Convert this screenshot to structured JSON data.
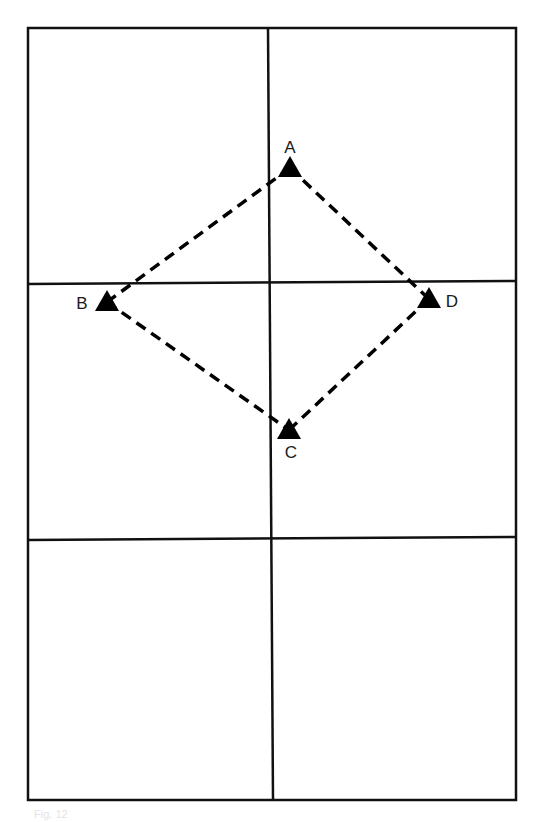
{
  "diagram": {
    "type": "grid-with-diamond",
    "grid": {
      "columns": 2,
      "rows": 3,
      "outer": {
        "left": 28,
        "top": 28,
        "right": 516,
        "bottom": 800
      },
      "vertical_line": {
        "x_top": 268,
        "x_bottom": 273
      },
      "horizontal_lines": [
        {
          "y_left": 284,
          "y_right": 281
        },
        {
          "y_left": 540,
          "y_right": 537
        }
      ],
      "stroke_color": "#111111"
    },
    "points": [
      {
        "id": "A",
        "label": "A",
        "x": 290,
        "y": 168,
        "label_x": 290,
        "label_y": 153,
        "anchor": "middle"
      },
      {
        "id": "B",
        "label": "B",
        "x": 107,
        "y": 302,
        "label_x": 82,
        "label_y": 309,
        "anchor": "middle"
      },
      {
        "id": "C",
        "label": "C",
        "x": 289,
        "y": 430,
        "label_x": 291,
        "label_y": 458,
        "anchor": "middle"
      },
      {
        "id": "D",
        "label": "D",
        "x": 429,
        "y": 299,
        "label_x": 452,
        "label_y": 307,
        "anchor": "middle"
      }
    ],
    "connections": [
      {
        "from": "A",
        "to": "B",
        "style": "dashed"
      },
      {
        "from": "B",
        "to": "C",
        "style": "dashed"
      },
      {
        "from": "C",
        "to": "D",
        "style": "dashed"
      },
      {
        "from": "D",
        "to": "A",
        "style": "dashed"
      }
    ],
    "marker_shape": "filled-triangle",
    "marker_color": "#000000",
    "caption": "Fig. 12"
  }
}
